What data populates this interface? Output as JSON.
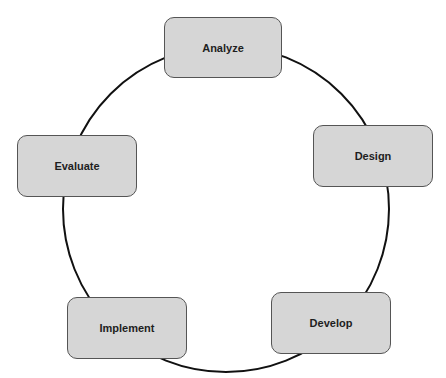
{
  "diagram": {
    "type": "cycle",
    "colors": {
      "node_fill": "#d6d6d6",
      "node_border": "#555555",
      "ring": "#111111",
      "text": "#1e1e1e"
    },
    "nodes": [
      {
        "id": "analyze",
        "label": "Analyze"
      },
      {
        "id": "design",
        "label": "Design"
      },
      {
        "id": "develop",
        "label": "Develop"
      },
      {
        "id": "implement",
        "label": "Implement"
      },
      {
        "id": "evaluate",
        "label": "Evaluate"
      }
    ]
  }
}
